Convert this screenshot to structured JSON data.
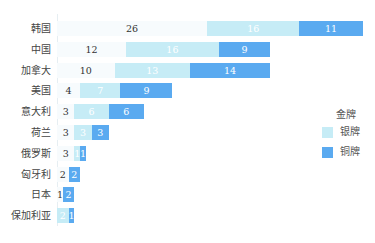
{
  "chart_data": {
    "type": "bar",
    "orientation": "horizontal",
    "stacked": true,
    "title": "",
    "xlabel": "",
    "ylabel": "",
    "categories": [
      "韩国",
      "中国",
      "加拿大",
      "美国",
      "意大利",
      "荷兰",
      "俄罗斯",
      "匈牙利",
      "日本",
      "保加利亚"
    ],
    "series": [
      {
        "name": "金牌",
        "color": "#f7fbfd",
        "values": [
          26,
          12,
          10,
          4,
          3,
          3,
          3,
          2,
          1,
          0
        ]
      },
      {
        "name": "银牌",
        "color": "#c6ecf6",
        "values": [
          16,
          16,
          13,
          7,
          6,
          3,
          1,
          0,
          0,
          2
        ]
      },
      {
        "name": "铜牌",
        "color": "#5aaaf0",
        "values": [
          11,
          9,
          14,
          9,
          6,
          3,
          1,
          2,
          2,
          1
        ]
      }
    ],
    "legend": {
      "title": "金牌",
      "position": "right",
      "entries": [
        "银牌",
        "铜牌"
      ]
    },
    "grid": false,
    "data_labels": true
  },
  "legend": {
    "title": "金牌",
    "items": [
      {
        "label": "银牌",
        "color": "#c6ecf6"
      },
      {
        "label": "铜牌",
        "color": "#5aaaf0"
      }
    ]
  }
}
